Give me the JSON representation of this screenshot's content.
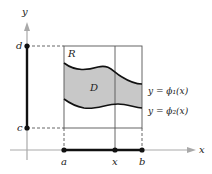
{
  "diagram": {
    "type": "region-of-integration",
    "axes": {
      "x_label": "x",
      "y_label": "y"
    },
    "rectangle": {
      "label": "R"
    },
    "region": {
      "label": "D",
      "fill": "#c8c8c8"
    },
    "x_ticks": [
      "a",
      "x",
      "b"
    ],
    "y_ticks": [
      "d",
      "c"
    ],
    "curves": [
      {
        "name": "upper",
        "label": "y = ϕ₁(x)"
      },
      {
        "name": "lower",
        "label": "y = ϕ₂(x)"
      }
    ],
    "colors": {
      "axis": "#a9a9a9",
      "line": "#111111",
      "grid": "#555555",
      "fill": "#c8c8c8"
    }
  }
}
